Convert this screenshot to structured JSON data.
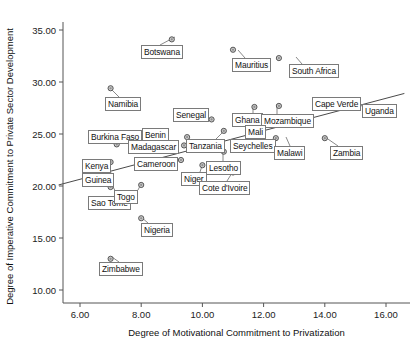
{
  "chart_data": {
    "type": "scatter",
    "title": "",
    "xlabel": "Degree of Motivational Commitment to Privatization",
    "ylabel": "Degree of Imperative Commitment to Private Sector Development",
    "xlim": [
      5.0,
      16.8
    ],
    "ylim": [
      9.0,
      36.2
    ],
    "xticks": [
      "6.00",
      "8.00",
      "10.00",
      "12.00",
      "14.00",
      "16.00"
    ],
    "xtick_values": [
      6,
      8,
      10,
      12,
      14,
      16
    ],
    "yticks": [
      "10.00",
      "15.00",
      "20.00",
      "25.00",
      "30.00",
      "35.00"
    ],
    "ytick_values": [
      10,
      15,
      20,
      25,
      30,
      35
    ],
    "grid": false,
    "legend": null,
    "marker_style": "circle-open-gray",
    "trendline": {
      "label": "linear fit",
      "x0": 5.3,
      "y0": 20.1,
      "x1": 16.6,
      "y1": 28.9
    },
    "points": [
      {
        "label": "Botswana",
        "x": 9.0,
        "y": 34.1
      },
      {
        "label": "Mauritius",
        "x": 11.0,
        "y": 33.1
      },
      {
        "label": "South Africa",
        "x": 12.5,
        "y": 32.3
      },
      {
        "label": "Namibia",
        "x": 7.0,
        "y": 29.4
      },
      {
        "label": "Senegal",
        "x": 10.3,
        "y": 26.4
      },
      {
        "label": "Uganda",
        "x": 15.0,
        "y": 28.0
      },
      {
        "label": "Cape Verde",
        "x": 13.7,
        "y": 27.6
      },
      {
        "label": "Ghana",
        "x": 11.7,
        "y": 27.6
      },
      {
        "label": "Mozambique",
        "x": 12.5,
        "y": 27.7
      },
      {
        "label": "Benin",
        "x": 9.5,
        "y": 24.7
      },
      {
        "label": "Burkina Faso",
        "x": 7.2,
        "y": 24.0
      },
      {
        "label": "Madagascar",
        "x": 9.4,
        "y": 23.9
      },
      {
        "label": "Mali",
        "x": 12.0,
        "y": 26.2
      },
      {
        "label": "Tanzania",
        "x": 10.7,
        "y": 25.3
      },
      {
        "label": "Seychelles",
        "x": 11.9,
        "y": 25.4
      },
      {
        "label": "Malawi",
        "x": 12.4,
        "y": 24.6
      },
      {
        "label": "Zambia",
        "x": 14.0,
        "y": 24.6
      },
      {
        "label": "Cameroon",
        "x": 9.3,
        "y": 22.5
      },
      {
        "label": "Kenya",
        "x": 7.0,
        "y": 22.3
      },
      {
        "label": "Niger",
        "x": 10.0,
        "y": 22.0
      },
      {
        "label": "Lesotho",
        "x": 10.7,
        "y": 23.3
      },
      {
        "label": "Guinea",
        "x": 7.0,
        "y": 21.0
      },
      {
        "label": "Sao Tome",
        "x": 7.0,
        "y": 19.9
      },
      {
        "label": "Togo",
        "x": 8.0,
        "y": 20.1
      },
      {
        "label": "Cote d'Ivoire",
        "x": 11.0,
        "y": 21.3
      },
      {
        "label": "Nigeria",
        "x": 8.0,
        "y": 16.9
      },
      {
        "label": "Zimbabwe",
        "x": 7.0,
        "y": 13.0
      }
    ],
    "labels": [
      {
        "text": "Botswana",
        "bx": 141,
        "by": 45,
        "lx": 175,
        "ly": 37,
        "lex": 160,
        "ley": 45
      },
      {
        "text": "Mauritius",
        "bx": 232,
        "by": 58,
        "lx": 238,
        "ly": 50,
        "lex": 245,
        "ley": 58
      },
      {
        "text": "South Africa",
        "bx": 289,
        "by": 64,
        "lx": 296,
        "ly": 57,
        "lex": 302,
        "ley": 64
      },
      {
        "text": "Namibia",
        "bx": 105,
        "by": 97,
        "lx": 112,
        "ly": 90,
        "lex": 119,
        "ley": 97
      },
      {
        "text": "Senegal",
        "bx": 173,
        "by": 108,
        "lx": 203,
        "ly": 120,
        "lex": 195,
        "ley": 115
      },
      {
        "text": "Uganda",
        "bx": 362,
        "by": 104,
        "lx": 355,
        "ly": 103,
        "lex": 362,
        "ley": 106
      },
      {
        "text": "Cape Verde",
        "bx": 312,
        "by": 97,
        "lx": 334,
        "ly": 107,
        "lex": 334,
        "ley": 104
      },
      {
        "text": "Ghana",
        "bx": 232,
        "by": 113,
        "lx": 253,
        "ly": 105,
        "lex": 253,
        "ley": 113
      },
      {
        "text": "Mozambique",
        "bx": 261,
        "by": 114,
        "lx": 277,
        "ly": 104,
        "lex": 277,
        "ley": 114
      },
      {
        "text": "Benin",
        "bx": 142,
        "by": 128,
        "lx": 149,
        "ly": 137,
        "lex": 156,
        "ley": 134
      },
      {
        "text": "Burkina Faso",
        "bx": 88,
        "by": 130,
        "lx": 118,
        "ly": 145,
        "lex": 112,
        "ley": 140
      },
      {
        "text": "Madagascar",
        "bx": 128,
        "by": 140,
        "lx": 164,
        "ly": 144,
        "lex": 160,
        "ley": 144
      },
      {
        "text": "Mali",
        "bx": 245,
        "by": 125,
        "lx": 263,
        "ly": 119,
        "lex": 262,
        "ley": 125
      },
      {
        "text": "Tanzania",
        "bx": 186,
        "by": 139,
        "lx": 223,
        "ly": 132,
        "lex": 216,
        "ley": 139
      },
      {
        "text": "Seychelles",
        "bx": 230,
        "by": 139,
        "lx": 251,
        "ly": 133,
        "lex": 251,
        "ley": 139
      },
      {
        "text": "Malawi",
        "bx": 274,
        "by": 146,
        "lx": 286,
        "ly": 137,
        "lex": 290,
        "ley": 146
      },
      {
        "text": "Zambia",
        "bx": 330,
        "by": 146,
        "lx": 325,
        "ly": 137,
        "lex": 338,
        "ley": 146
      },
      {
        "text": "Cameroon",
        "bx": 134,
        "by": 157,
        "lx": 162,
        "ly": 165,
        "lex": 162,
        "ley": 167
      },
      {
        "text": "Kenya",
        "bx": 82,
        "by": 159,
        "lx": 112,
        "ly": 160,
        "lex": 108,
        "ley": 163
      },
      {
        "text": "Niger",
        "bx": 181,
        "by": 172,
        "lx": 202,
        "ly": 166,
        "lex": 200,
        "ley": 172
      },
      {
        "text": "Lesotho",
        "bx": 206,
        "by": 161,
        "lx": 223,
        "ly": 152,
        "lex": 223,
        "ley": 161
      },
      {
        "text": "Guinea",
        "bx": 82,
        "by": 173,
        "lx": 112,
        "ly": 173,
        "lex": 108,
        "ley": 177
      },
      {
        "text": "Sao Tome",
        "bx": 88,
        "by": 196,
        "lx": 112,
        "ly": 185,
        "lex": 118,
        "ley": 196
      },
      {
        "text": "Togo",
        "bx": 114,
        "by": 190,
        "lx": 141,
        "ly": 184,
        "lex": 138,
        "ley": 190
      },
      {
        "text": "Cote d'Ivoire",
        "bx": 199,
        "by": 181,
        "lx": 232,
        "ly": 173,
        "lex": 227,
        "ley": 181
      },
      {
        "text": "Nigeria",
        "bx": 141,
        "by": 223,
        "lx": 141,
        "ly": 217,
        "lex": 148,
        "ley": 223
      },
      {
        "text": "Zimbabwe",
        "bx": 99,
        "by": 262,
        "lx": 112,
        "ly": 257,
        "lex": 119,
        "ley": 262
      }
    ]
  }
}
